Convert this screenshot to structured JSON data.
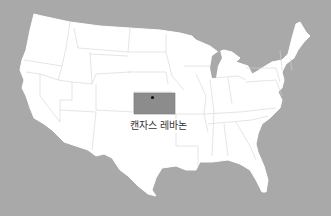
{
  "map": {
    "title": "United States",
    "background_color": "#a9a9a9",
    "land_color": "#ffffff",
    "border_color": "#d4d4d4",
    "highlight": {
      "state": "Kansas",
      "color": "#8c8c8c"
    },
    "marker": {
      "label": "캔자스 레바논",
      "color": "#111111"
    }
  }
}
